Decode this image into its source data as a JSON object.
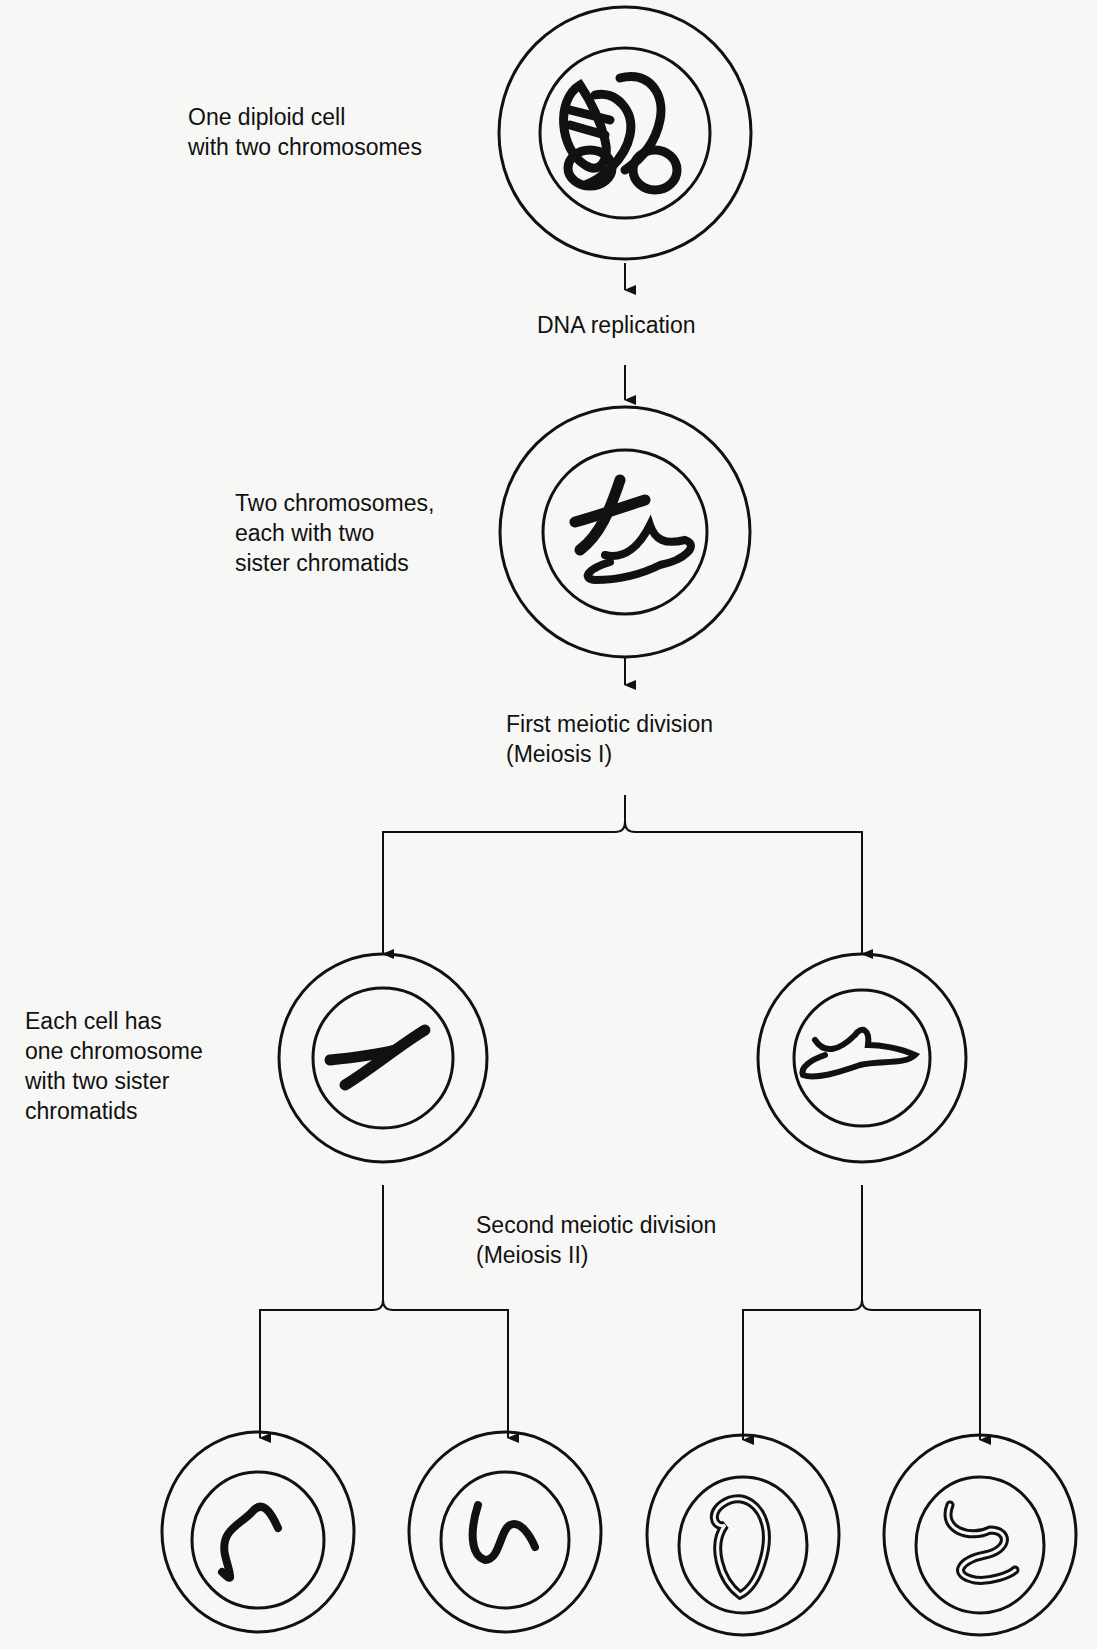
{
  "labels": {
    "cell1": "One diploid cell\nwith two chromosomes",
    "dna_replication": "DNA replication",
    "cell2": "Two chromosomes,\neach with two\nsister chromatids",
    "meiosis1": "First meiotic division\n(Meiosis I)",
    "cell3": "Each cell has\none chromosome\nwith two sister\nchromatids",
    "meiosis2": "Second meiotic division\n(Meiosis II)"
  },
  "colors": {
    "ink": "#111111",
    "paper": "#f7f7f5"
  }
}
